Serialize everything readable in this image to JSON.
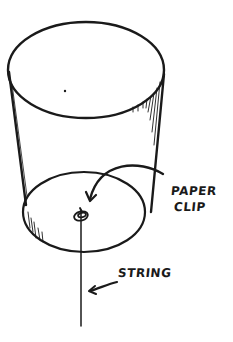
{
  "diagram": {
    "labels": {
      "paper_clip_line1": "PAPER",
      "paper_clip_line2": "CLIP",
      "string": "STRING"
    },
    "colors": {
      "ink": "#1a1a1a",
      "background": "#ffffff"
    }
  }
}
